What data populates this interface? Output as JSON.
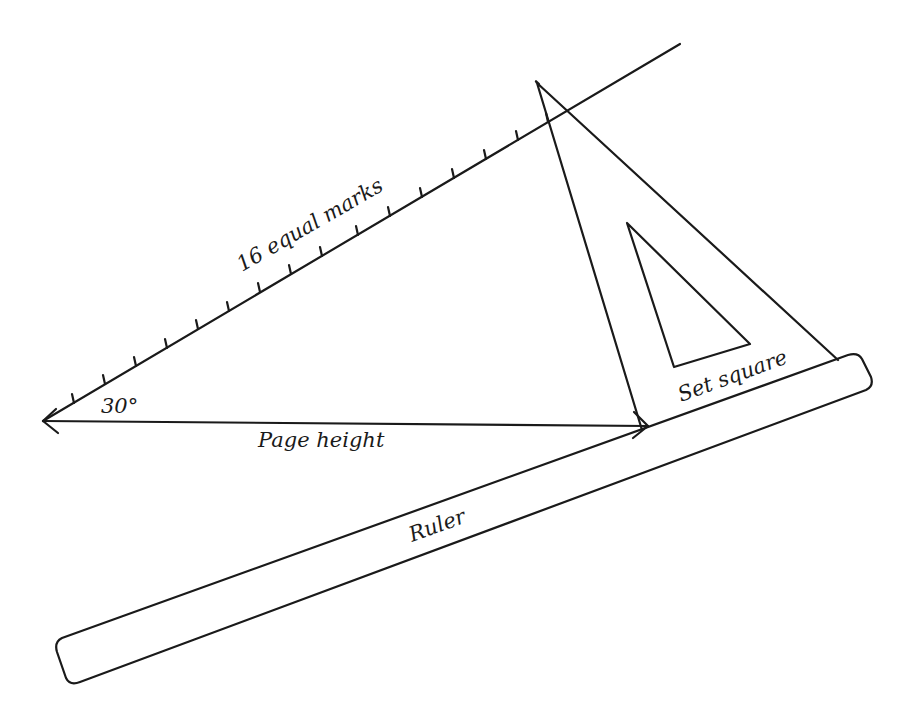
{
  "diagram": {
    "colors": {
      "ink": "#1a1a1a",
      "background": "#ffffff"
    },
    "labels": {
      "angle": "30°",
      "marks": "16 equal marks",
      "page_height": "Page height",
      "set_square": "Set square",
      "ruler": "Ruler"
    },
    "components": {
      "diagonal_line": {
        "label": "16 equal marks",
        "angle_deg": 30,
        "tick_count": 16
      },
      "horizontal_arrow": {
        "label": "Page height",
        "direction": "double-headed"
      },
      "set_square": {
        "label": "Set square",
        "shape": "triangle with triangular cutout"
      },
      "ruler": {
        "label": "Ruler",
        "shape": "long rounded rectangle"
      }
    }
  }
}
